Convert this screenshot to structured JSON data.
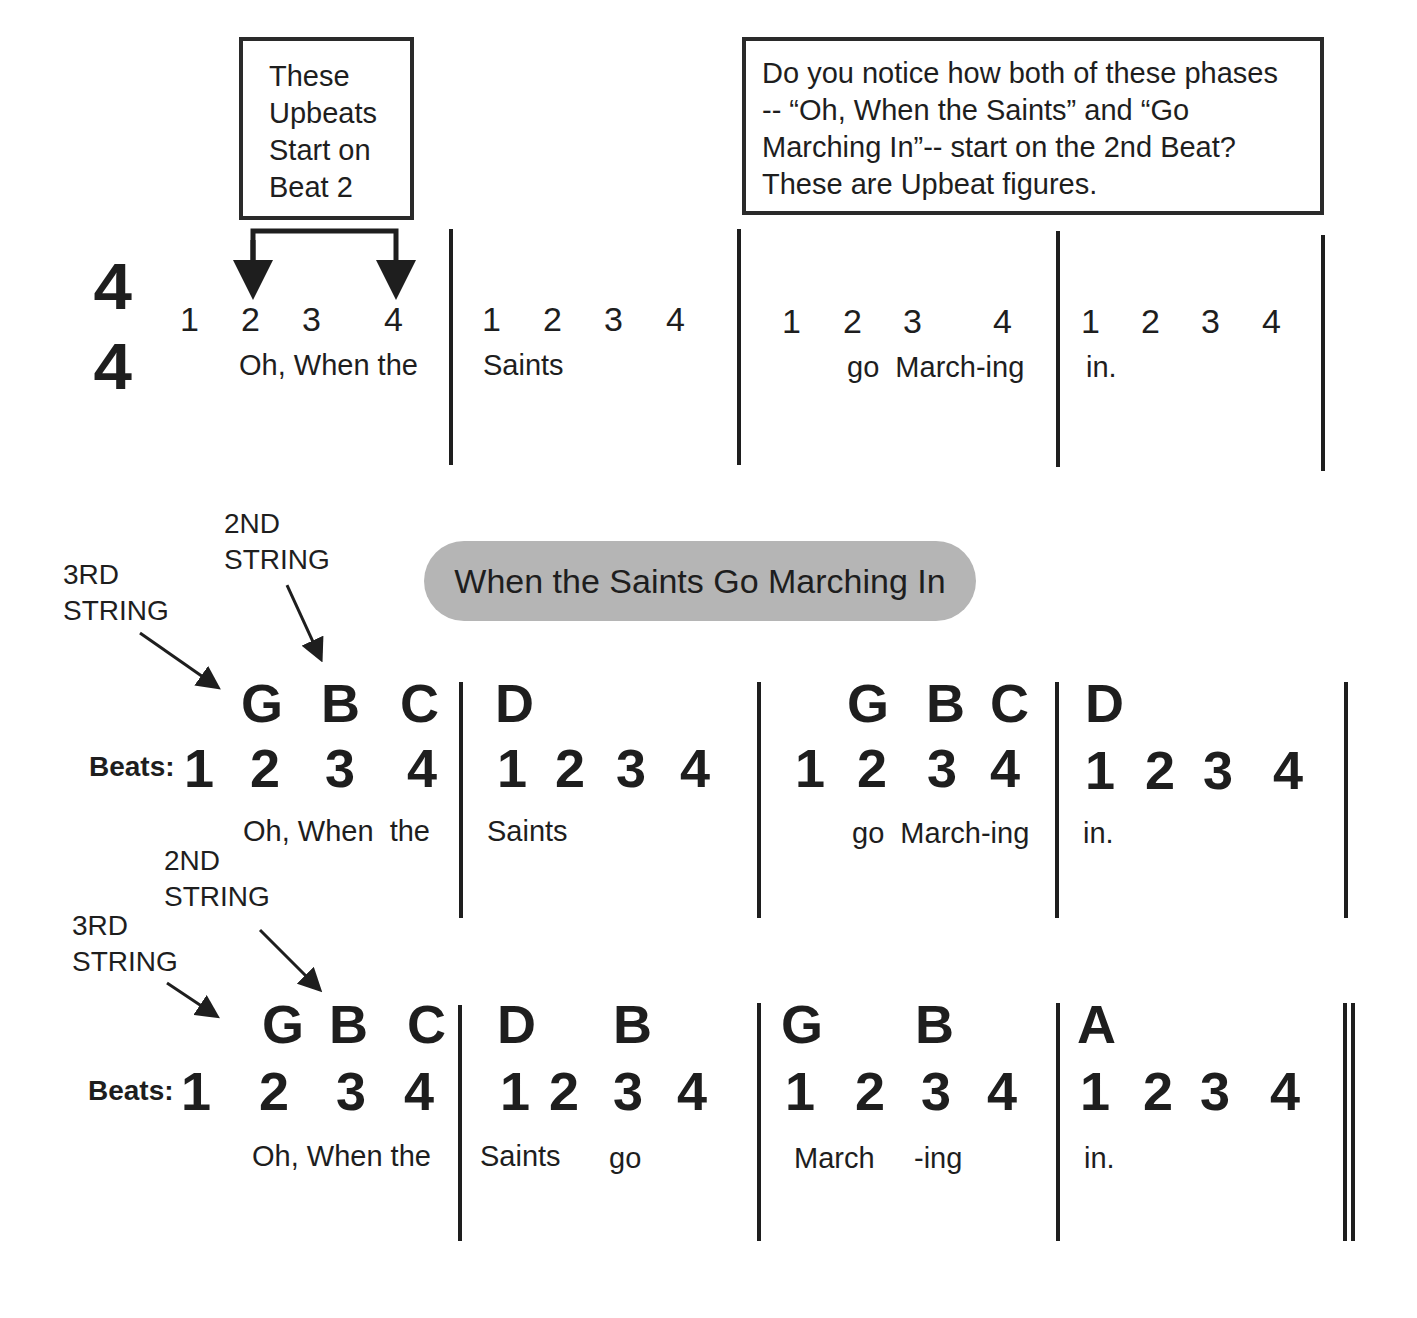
{
  "callouts": {
    "upbeats_box": "These\nUpbeats\nStart on\nBeat 2",
    "notice_box": "Do you notice how both of these phases\n-- “Oh, When the Saints” and “Go\nMarching In”-- start on the 2nd Beat?\nThese are Upbeat figures."
  },
  "time_signature": {
    "top": "4",
    "bottom": "4"
  },
  "rhythm_line": {
    "measures": [
      {
        "beats": [
          "1",
          "2",
          "3",
          "4"
        ],
        "lyrics": "Oh, When the"
      },
      {
        "beats": [
          "1",
          "2",
          "3",
          "4"
        ],
        "lyrics": "Saints"
      },
      {
        "beats": [
          "1",
          "2",
          "3",
          "4"
        ],
        "lyrics": "go  March-ing"
      },
      {
        "beats": [
          "1",
          "2",
          "3",
          "4"
        ],
        "lyrics": "in."
      }
    ]
  },
  "song_title": "When the Saints Go Marching In",
  "string_labels": {
    "third": "3RD\nSTRING",
    "second": "2ND\nSTRING"
  },
  "beats_label": "Beats:",
  "line1": {
    "measures": [
      {
        "notes": [
          "G",
          "B",
          "C"
        ],
        "beats": [
          "1",
          "2",
          "3",
          "4"
        ],
        "lyrics": "Oh, When  the"
      },
      {
        "notes": [
          "D"
        ],
        "beats": [
          "1",
          "2",
          "3",
          "4"
        ],
        "lyrics": "Saints"
      },
      {
        "notes": [
          "G",
          "B",
          "C"
        ],
        "beats": [
          "1",
          "2",
          "3",
          "4"
        ],
        "lyrics": "go  March-ing"
      },
      {
        "notes": [
          "D"
        ],
        "beats": [
          "1",
          "2",
          "3",
          "4"
        ],
        "lyrics": "in."
      }
    ]
  },
  "line2": {
    "measures": [
      {
        "notes": [
          "G",
          "B",
          "C"
        ],
        "beats": [
          "1",
          "2",
          "3",
          "4"
        ],
        "lyrics": "Oh, When the"
      },
      {
        "notes": [
          "D",
          "B"
        ],
        "beats": [
          "1",
          "2",
          "3",
          "4"
        ],
        "lyrics": [
          "Saints",
          "go"
        ]
      },
      {
        "notes": [
          "G",
          "B"
        ],
        "beats": [
          "1",
          "2",
          "3",
          "4"
        ],
        "lyrics": [
          "March",
          "-ing"
        ]
      },
      {
        "notes": [
          "A"
        ],
        "beats": [
          "1",
          "2",
          "3",
          "4"
        ],
        "lyrics": "in."
      }
    ]
  },
  "colors": {
    "ink": "#1e1e1e",
    "pill": "#b5b5b5"
  }
}
